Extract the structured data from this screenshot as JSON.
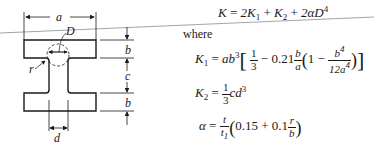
{
  "figure": {
    "labels": {
      "a": "a",
      "b_top": "b",
      "c": "c",
      "b_bottom": "b",
      "d": "d",
      "D": "D",
      "r": "r"
    }
  },
  "equations": {
    "main": {
      "lhs": "K",
      "eq": "=",
      "t1": "2K",
      "t1_sub": "1",
      "plus1": "+",
      "t2": "K",
      "t2_sub": "2",
      "plus2": "+",
      "t3": "2αD",
      "t3_sup": "4"
    },
    "where_label": "where",
    "k1": {
      "lhs": "K",
      "lhs_sub": "1",
      "eq": "=",
      "coef": "ab",
      "coef_sup": "3",
      "frac1_num": "1",
      "frac1_den": "3",
      "minus1": "−",
      "c021": "0.21",
      "frac2_num": "b",
      "frac2_den": "a",
      "one": "1",
      "minus2": "−",
      "frac3_num": "b",
      "frac3_num_sup": "4",
      "frac3_den": "12a",
      "frac3_den_sup": "4"
    },
    "k2": {
      "lhs": "K",
      "lhs_sub": "2",
      "eq": "=",
      "frac_num": "1",
      "frac_den": "3",
      "rhs": "cd",
      "rhs_sup": "3"
    },
    "alpha": {
      "lhs": "α",
      "eq": "=",
      "frac_num": "t",
      "frac_den": "t",
      "frac_den_sub": "1",
      "c015": "0.15",
      "plus": "+",
      "c01": "0.1",
      "frac2_num": "r",
      "frac2_den": "b"
    }
  },
  "colors": {
    "ink": "#1a1a1a",
    "rule": "#9a9a9a",
    "background": "#ffffff"
  }
}
